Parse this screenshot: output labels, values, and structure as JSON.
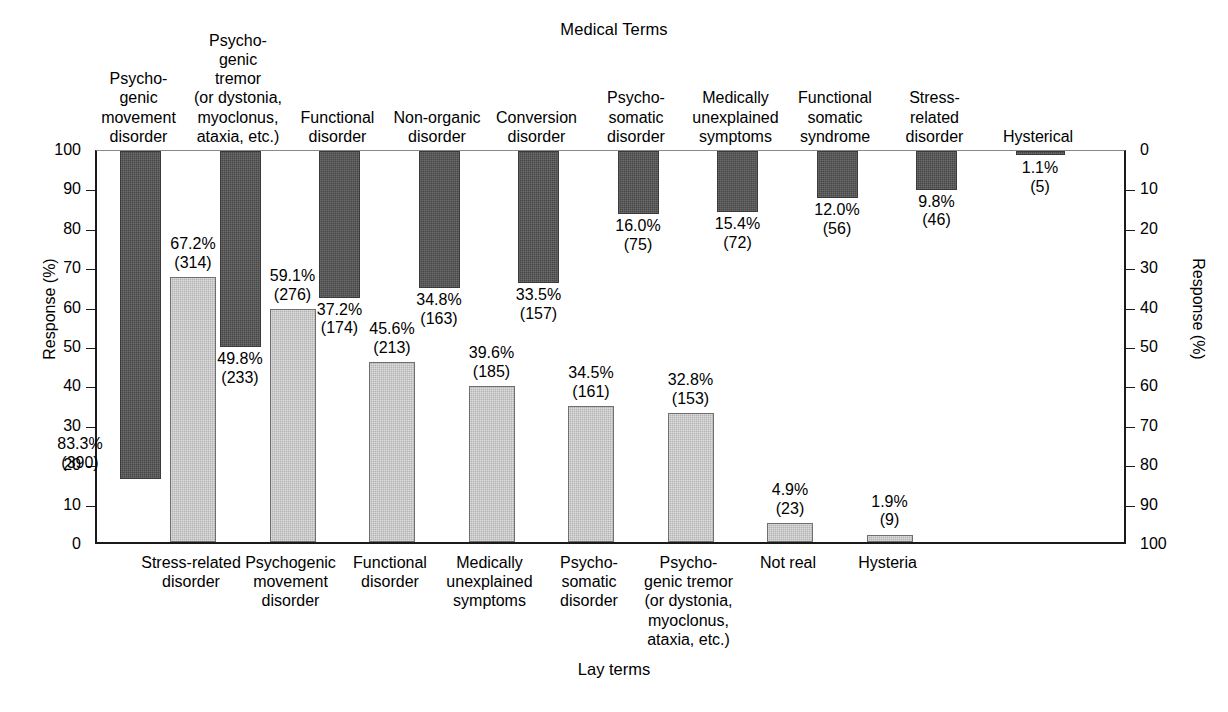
{
  "chart_data": {
    "type": "bar",
    "title": "Medical Terms",
    "xlabel": "Lay terms",
    "ylabel": "Response (%)",
    "ylabel_right": "Response (%)",
    "ylim": [
      0,
      100
    ],
    "ylim_right": [
      0,
      100
    ],
    "right_axis_inverted": true,
    "grid": false,
    "legend": "none",
    "yticks": [
      "0",
      "10",
      "20",
      "30",
      "40",
      "50",
      "60",
      "70",
      "80",
      "90",
      "100"
    ],
    "yticks_right": [
      "0",
      "10",
      "20",
      "30",
      "40",
      "50",
      "60",
      "70",
      "80",
      "90",
      "100"
    ],
    "series": [
      {
        "name": "Medical Terms",
        "orientation": "top-down",
        "axis": "right",
        "color": "#474747",
        "categories": [
          "Psycho-genic movement disorder",
          "Psycho-genic tremor (or dystonia, myoclonus, ataxia, etc.)",
          "Functional disorder",
          "Non-organic disorder",
          "Conversion disorder",
          "Psycho-somatic disorder",
          "Medically unexplained symptoms",
          "Functional somatic syndrome",
          "Stress-related disorder",
          "Hysterical"
        ],
        "values": [
          83.3,
          49.8,
          37.2,
          34.8,
          33.5,
          16.0,
          15.4,
          12.0,
          9.8,
          1.1
        ],
        "counts": [
          390,
          233,
          174,
          163,
          157,
          75,
          72,
          56,
          46,
          5
        ],
        "labels": [
          "83.3%",
          "49.8%",
          "37.2%",
          "34.8%",
          "33.5%",
          "16.0%",
          "15.4%",
          "12.0%",
          "9.8%",
          "1.1%"
        ],
        "count_labels": [
          "(390)",
          "(233)",
          "(174)",
          "(163)",
          "(157)",
          "(75)",
          "(72)",
          "(56)",
          "(46)",
          "(5)"
        ]
      },
      {
        "name": "Lay terms",
        "orientation": "bottom-up",
        "axis": "left",
        "color": "#b4b4b4",
        "categories": [
          "Stress-related disorder",
          "Psychogenic movement disorder",
          "Functional disorder",
          "Medically unexplained symptoms",
          "Psycho-somatic disorder",
          "Psycho-genic tremor (or dystonia, myoclonus, ataxia, etc.)",
          "Not real",
          "Hysteria"
        ],
        "values": [
          67.2,
          59.1,
          45.6,
          39.6,
          34.5,
          32.8,
          4.9,
          1.9
        ],
        "counts": [
          314,
          276,
          213,
          185,
          161,
          153,
          23,
          9
        ],
        "labels": [
          "67.2%",
          "59.1%",
          "45.6%",
          "39.6%",
          "34.5%",
          "32.8%",
          "4.9%",
          "1.9%"
        ],
        "count_labels": [
          "(314)",
          "(276)",
          "(213)",
          "(185)",
          "(161)",
          "(153)",
          "(23)",
          "(9)"
        ]
      }
    ]
  },
  "top_labels": [
    {
      "text": "Psycho-\ngenic\nmovement\ndisorder"
    },
    {
      "text": "Psycho-\ngenic\ntremor\n(or dystonia,\nmyoclonus,\nataxia, etc.)"
    },
    {
      "text": "Functional\ndisorder"
    },
    {
      "text": "Non-organic\ndisorder"
    },
    {
      "text": "Conversion\ndisorder"
    },
    {
      "text": "Psycho-\nsomatic\ndisorder"
    },
    {
      "text": "Medically\nunexplained\nsymptoms"
    },
    {
      "text": "Functional\nsomatic\nsyndrome"
    },
    {
      "text": "Stress-\nrelated\ndisorder"
    },
    {
      "text": "Hysterical"
    }
  ],
  "bottom_labels": [
    {
      "text": "Stress-related\ndisorder"
    },
    {
      "text": "Psychogenic\nmovement\ndisorder"
    },
    {
      "text": "Functional\ndisorder"
    },
    {
      "text": "Medically\nunexplained\nsymptoms"
    },
    {
      "text": "Psycho-\nsomatic\ndisorder"
    },
    {
      "text": "Psycho-\ngenic tremor\n(or dystonia,\nmyoclonus,\nataxia, etc.)"
    },
    {
      "text": "Not real"
    },
    {
      "text": "Hysteria"
    }
  ]
}
